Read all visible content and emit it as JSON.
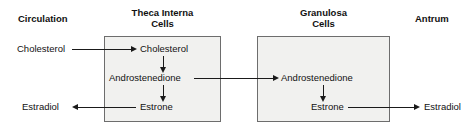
{
  "diagram": {
    "compartments": {
      "circulation": {
        "heading": "Circulation"
      },
      "theca": {
        "heading_line1": "Theca Interna",
        "heading_line2": "Cells"
      },
      "granulosa": {
        "heading_line1": "Granulosa",
        "heading_line2": "Cells"
      },
      "antrum": {
        "heading": "Antrum"
      }
    },
    "molecules": {
      "circulation_cholesterol": "Cholesterol",
      "circulation_estradiol": "Estradiol",
      "theca_cholesterol": "Cholesterol",
      "theca_androstenedione": "Androstenedione",
      "theca_estrone": "Estrone",
      "granulosa_androstenedione": "Androstenedione",
      "granulosa_estrone": "Estrone",
      "antrum_estradiol": "Estradiol"
    },
    "arrows": [
      {
        "name": "cholesterol-uptake",
        "from": "circulation_cholesterol",
        "to": "theca_cholesterol",
        "direction": "right"
      },
      {
        "name": "cholesterol-to-androstenedione",
        "from": "theca_cholesterol",
        "to": "theca_androstenedione",
        "direction": "down"
      },
      {
        "name": "androstenedione-transfer",
        "from": "theca_androstenedione",
        "to": "granulosa_androstenedione",
        "direction": "right"
      },
      {
        "name": "androstenedione-to-estrone-theca",
        "from": "theca_androstenedione",
        "to": "theca_estrone",
        "direction": "down"
      },
      {
        "name": "theca-estrone-to-circulation-estradiol",
        "from": "theca_estrone",
        "to": "circulation_estradiol",
        "direction": "left"
      },
      {
        "name": "androstenedione-to-estrone-granulosa",
        "from": "granulosa_androstenedione",
        "to": "granulosa_estrone",
        "direction": "down"
      },
      {
        "name": "granulosa-estrone-to-antrum-estradiol",
        "from": "granulosa_estrone",
        "to": "antrum_estradiol",
        "direction": "right"
      }
    ],
    "colors": {
      "box_fill": "#f1f1ef",
      "box_border": "#6d6d6d",
      "line": "#1a1a1a",
      "text": "#111111",
      "background": "#ffffff"
    }
  }
}
